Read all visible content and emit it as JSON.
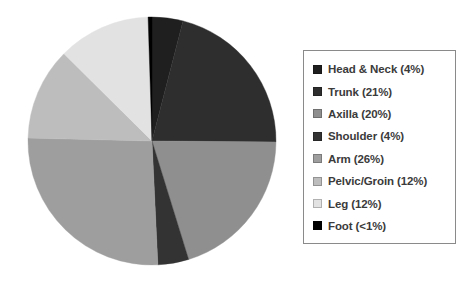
{
  "chart_data": {
    "type": "pie",
    "title": "",
    "subtitle": "",
    "xlabel": "",
    "ylabel": "",
    "legend_position": "right",
    "grid": false,
    "start_angle_deg": 0,
    "direction": "clockwise",
    "categories": [
      "Head & Neck",
      "Trunk",
      "Axilla",
      "Shoulder",
      "Arm",
      "Pelvic/Groin",
      "Leg",
      "Foot"
    ],
    "values": [
      4,
      21,
      20,
      4,
      26,
      12,
      12,
      0.5
    ],
    "value_display": [
      "4%",
      "21%",
      "20%",
      "4%",
      "26%",
      "12%",
      "12%",
      "<1%"
    ],
    "colors": [
      "#1f1f1f",
      "#2e2e2e",
      "#8f8f8f",
      "#333333",
      "#9e9e9e",
      "#bdbdbd",
      "#e2e2e2",
      "#000000"
    ],
    "legend_entries": [
      {
        "label": "Head & Neck (4%)",
        "color": "#1f1f1f"
      },
      {
        "label": "Trunk (21%)",
        "color": "#2e2e2e"
      },
      {
        "label": "Axilla (20%)",
        "color": "#8f8f8f"
      },
      {
        "label": "Shoulder (4%)",
        "color": "#333333"
      },
      {
        "label": "Arm (26%)",
        "color": "#9e9e9e"
      },
      {
        "label": "Pelvic/Groin (12%)",
        "color": "#bdbdbd"
      },
      {
        "label": "Leg (12%)",
        "color": "#e2e2e2"
      },
      {
        "label": "Foot (<1%)",
        "color": "#000000"
      }
    ]
  }
}
